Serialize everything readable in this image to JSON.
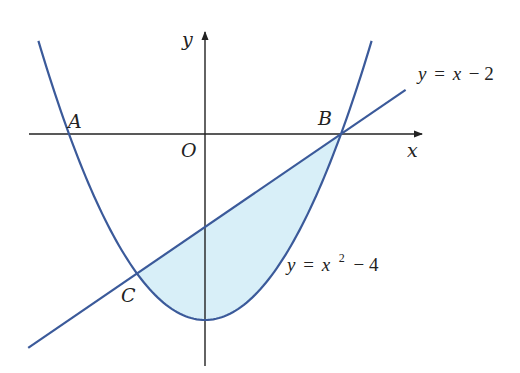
{
  "diagram": {
    "type": "coordinate-plane-region",
    "axes": {
      "x_label": "x",
      "y_label": "y",
      "origin_label": "O",
      "origin_px": [
        205,
        134
      ],
      "unit_px": {
        "x": 68,
        "y": 46.5
      }
    },
    "curves": [
      {
        "name": "parabola",
        "equation": "y = x^2 - 4",
        "label_parts": {
          "lhs": "y",
          "eq": "=",
          "var": "x",
          "exp": "2",
          "rest": "− 4"
        },
        "x_range": [
          -2.45,
          2.45
        ]
      },
      {
        "name": "line",
        "equation": "y = x - 2",
        "label_parts": {
          "lhs": "y",
          "eq": "=",
          "var": "x",
          "rest": "− 2"
        },
        "x_range": [
          -2.6,
          2.95
        ]
      }
    ],
    "points": [
      {
        "label": "A",
        "x": -2,
        "y": 0
      },
      {
        "label": "B",
        "x": 2,
        "y": 0
      },
      {
        "label": "C",
        "x": -1,
        "y": -3
      }
    ],
    "shaded_region": {
      "description": "region between y = x - 2 (above) and y = x^2 - 4 (below) for -1 <= x <= 2",
      "fill": "#d8eff8"
    },
    "colors": {
      "curve": "#3b5a9a",
      "axis": "#222222",
      "shade": "#d8eff8"
    }
  }
}
